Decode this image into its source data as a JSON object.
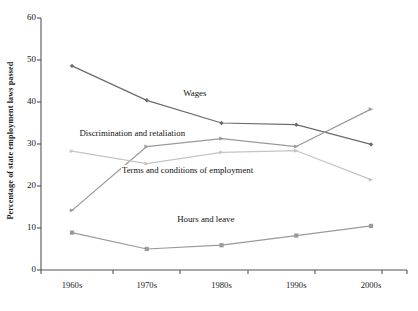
{
  "chart_data": {
    "type": "line",
    "title": "",
    "subtitle": "",
    "xlabel": "",
    "ylabel": "Percentage of state employment laws passed",
    "categories": [
      "1960s",
      "1970s",
      "1980s",
      "1990s",
      "2000s"
    ],
    "ylim": [
      0,
      60
    ],
    "yticks": [
      0,
      10,
      20,
      30,
      40,
      50,
      60
    ],
    "ytick_labels": [
      "0",
      "10",
      "20",
      "30",
      "40",
      "50",
      "60"
    ],
    "grid": false,
    "legend_position": "inline-annotations",
    "series": [
      {
        "name": "Wages",
        "values": [
          48.6,
          40.4,
          35.0,
          34.6,
          29.9
        ],
        "color": "#6b6b6b",
        "marker": "diamond"
      },
      {
        "name": "Discrimination and retaliation",
        "values": [
          14.2,
          29.4,
          31.3,
          29.4,
          38.3
        ],
        "color": "#9a9a9a",
        "marker": "triangle"
      },
      {
        "name": "Terms and conditions of employment",
        "values": [
          28.3,
          25.3,
          28.0,
          28.4,
          21.5
        ],
        "color": "#c4c4c4",
        "marker": "triangle"
      },
      {
        "name": "Hours and leave",
        "values": [
          8.9,
          5.0,
          5.9,
          8.2,
          10.5
        ],
        "color": "#9a9a9a",
        "marker": "square"
      }
    ],
    "annotations": [
      {
        "text": "Wages",
        "x_pct": 42.0,
        "y_value": 41.8
      },
      {
        "text": "Discrimination and retaliation",
        "x_pct": 25.0,
        "y_value": 32.4
      },
      {
        "text": "Terms and conditions of employment",
        "x_pct": 40.0,
        "y_value": 23.6
      },
      {
        "text": "Hours and leave",
        "x_pct": 45.0,
        "y_value": 11.9
      }
    ]
  },
  "axes": {
    "axis_color": "#555555",
    "text_color": "#1a1a1a",
    "background": "#ffffff"
  }
}
